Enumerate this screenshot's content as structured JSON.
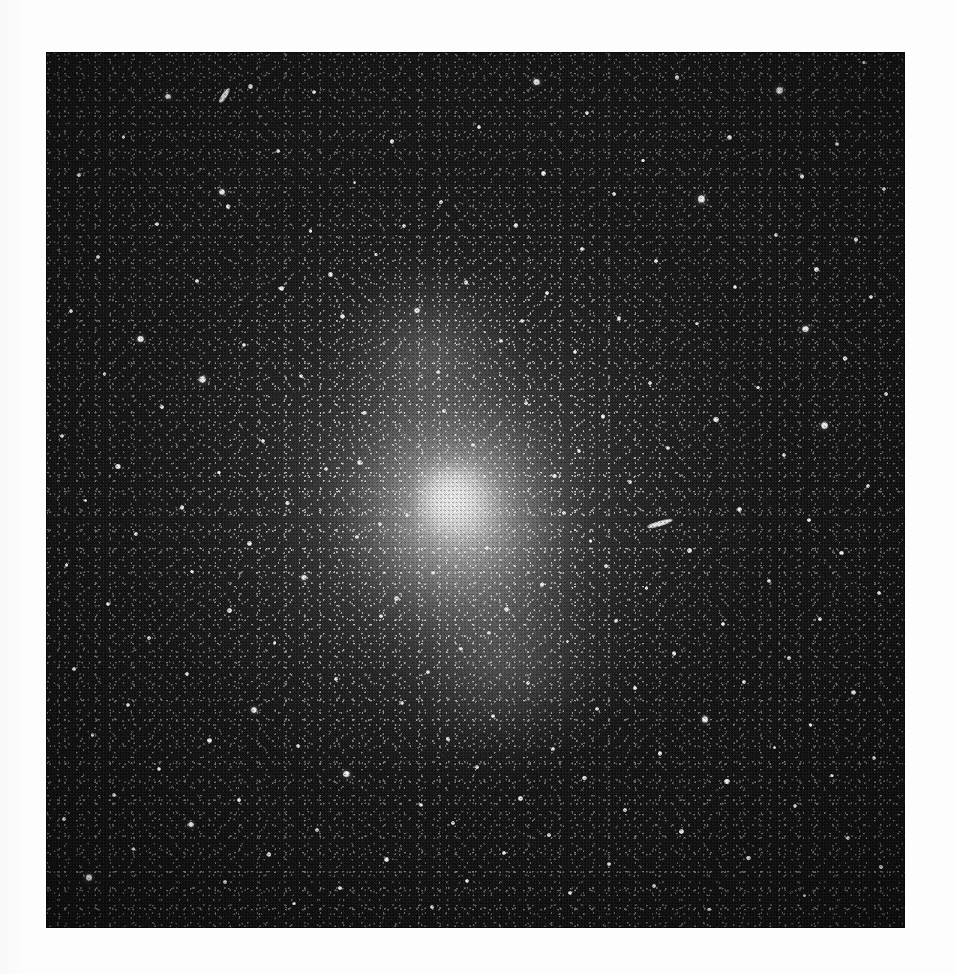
{
  "document": {
    "kind": "photographic-plate-reproduction",
    "subject": "globular star cluster",
    "caption": "",
    "background_color": "#fdfdfd"
  },
  "plate": {
    "left": 46,
    "top": 52,
    "width": 859,
    "height": 876,
    "sky_color": "#0c0c0c",
    "core_color": "#fcfcfc",
    "halo_color": "#9a9a9a"
  },
  "cluster": {
    "label": "globular cluster",
    "center_x_pct": 47,
    "center_y_pct": 50,
    "core_peak_x_pct": 47,
    "core_peak_y_pct": 51,
    "position_angle_deg": -18,
    "halo_extent_pct": 78
  },
  "defects": [
    {
      "name": "plate-scratch-upper-left",
      "x_pct": 19.8,
      "y_pct": 4.7,
      "length": 17,
      "thickness": 5,
      "angle": -58
    },
    {
      "name": "plate-scratch-mid-right",
      "x_pct": 70.0,
      "y_pct": 53.5,
      "length": 26,
      "thickness": 5,
      "angle": -17
    }
  ],
  "stars": [
    {
      "x": 14.2,
      "y": 5.1,
      "r": 2.4
    },
    {
      "x": 23.8,
      "y": 3.9,
      "r": 2.0
    },
    {
      "x": 31.2,
      "y": 4.6,
      "r": 1.6
    },
    {
      "x": 57.1,
      "y": 3.4,
      "r": 2.6
    },
    {
      "x": 73.5,
      "y": 2.9,
      "r": 1.8
    },
    {
      "x": 85.4,
      "y": 4.4,
      "r": 3.1
    },
    {
      "x": 95.2,
      "y": 1.2,
      "r": 1.5
    },
    {
      "x": 63.0,
      "y": 7.0,
      "r": 1.7
    },
    {
      "x": 50.4,
      "y": 8.6,
      "r": 1.6
    },
    {
      "x": 9.0,
      "y": 9.7,
      "r": 1.5
    },
    {
      "x": 40.3,
      "y": 10.2,
      "r": 1.9
    },
    {
      "x": 27.0,
      "y": 11.3,
      "r": 1.7
    },
    {
      "x": 79.6,
      "y": 9.8,
      "r": 2.1
    },
    {
      "x": 92.1,
      "y": 10.5,
      "r": 1.8
    },
    {
      "x": 69.5,
      "y": 12.4,
      "r": 1.6
    },
    {
      "x": 3.8,
      "y": 14.0,
      "r": 1.6
    },
    {
      "x": 35.9,
      "y": 14.9,
      "r": 1.6
    },
    {
      "x": 57.9,
      "y": 13.9,
      "r": 2.0
    },
    {
      "x": 88.0,
      "y": 14.2,
      "r": 2.0
    },
    {
      "x": 20.5,
      "y": 16.0,
      "r": 2.5
    },
    {
      "x": 21.2,
      "y": 17.6,
      "r": 2.0
    },
    {
      "x": 46.0,
      "y": 17.1,
      "r": 1.7
    },
    {
      "x": 66.1,
      "y": 16.2,
      "r": 1.5
    },
    {
      "x": 76.3,
      "y": 16.8,
      "r": 3.3
    },
    {
      "x": 97.5,
      "y": 15.6,
      "r": 1.7
    },
    {
      "x": 12.9,
      "y": 19.6,
      "r": 1.6
    },
    {
      "x": 30.8,
      "y": 20.4,
      "r": 1.6
    },
    {
      "x": 54.7,
      "y": 19.8,
      "r": 1.8
    },
    {
      "x": 85.0,
      "y": 20.9,
      "r": 2.0
    },
    {
      "x": 94.3,
      "y": 21.4,
      "r": 1.9
    },
    {
      "x": 6.1,
      "y": 23.4,
      "r": 1.7
    },
    {
      "x": 38.4,
      "y": 23.1,
      "r": 1.5
    },
    {
      "x": 62.4,
      "y": 22.5,
      "r": 1.6
    },
    {
      "x": 71.0,
      "y": 23.9,
      "r": 1.6
    },
    {
      "x": 89.7,
      "y": 24.8,
      "r": 2.2
    },
    {
      "x": 17.6,
      "y": 26.1,
      "r": 1.6
    },
    {
      "x": 27.4,
      "y": 27.0,
      "r": 2.3
    },
    {
      "x": 48.9,
      "y": 26.3,
      "r": 2.0
    },
    {
      "x": 58.3,
      "y": 27.5,
      "r": 1.6
    },
    {
      "x": 80.2,
      "y": 26.8,
      "r": 1.8
    },
    {
      "x": 96.0,
      "y": 28.0,
      "r": 1.7
    },
    {
      "x": 2.9,
      "y": 29.6,
      "r": 1.6
    },
    {
      "x": 34.5,
      "y": 30.2,
      "r": 2.1
    },
    {
      "x": 43.2,
      "y": 29.5,
      "r": 2.4
    },
    {
      "x": 66.7,
      "y": 30.4,
      "r": 1.9
    },
    {
      "x": 75.8,
      "y": 31.0,
      "r": 1.6
    },
    {
      "x": 88.4,
      "y": 31.6,
      "r": 2.8
    },
    {
      "x": 11.0,
      "y": 32.8,
      "r": 2.6
    },
    {
      "x": 23.0,
      "y": 33.5,
      "r": 1.7
    },
    {
      "x": 53.0,
      "y": 33.0,
      "r": 1.6
    },
    {
      "x": 61.6,
      "y": 34.3,
      "r": 1.7
    },
    {
      "x": 93.0,
      "y": 35.0,
      "r": 1.8
    },
    {
      "x": 6.8,
      "y": 36.8,
      "r": 1.6
    },
    {
      "x": 18.2,
      "y": 37.4,
      "r": 2.9
    },
    {
      "x": 29.7,
      "y": 37.0,
      "r": 1.8
    },
    {
      "x": 45.6,
      "y": 36.5,
      "r": 1.7
    },
    {
      "x": 70.3,
      "y": 37.8,
      "r": 2.0
    },
    {
      "x": 82.9,
      "y": 38.3,
      "r": 1.7
    },
    {
      "x": 97.8,
      "y": 39.0,
      "r": 1.6
    },
    {
      "x": 13.5,
      "y": 40.5,
      "r": 1.6
    },
    {
      "x": 37.1,
      "y": 41.2,
      "r": 1.9
    },
    {
      "x": 55.9,
      "y": 40.1,
      "r": 1.6
    },
    {
      "x": 64.8,
      "y": 41.6,
      "r": 1.8
    },
    {
      "x": 78.0,
      "y": 42.0,
      "r": 2.2
    },
    {
      "x": 90.6,
      "y": 42.6,
      "r": 3.0
    },
    {
      "x": 1.9,
      "y": 43.8,
      "r": 1.7
    },
    {
      "x": 25.3,
      "y": 44.4,
      "r": 1.8
    },
    {
      "x": 49.7,
      "y": 44.9,
      "r": 1.6
    },
    {
      "x": 72.4,
      "y": 45.2,
      "r": 1.7
    },
    {
      "x": 85.9,
      "y": 46.0,
      "r": 1.9
    },
    {
      "x": 8.4,
      "y": 47.3,
      "r": 2.3
    },
    {
      "x": 20.1,
      "y": 48.0,
      "r": 1.6
    },
    {
      "x": 32.6,
      "y": 47.6,
      "r": 1.7
    },
    {
      "x": 59.2,
      "y": 48.4,
      "r": 1.8
    },
    {
      "x": 68.0,
      "y": 49.1,
      "r": 1.6
    },
    {
      "x": 95.7,
      "y": 49.6,
      "r": 1.7
    },
    {
      "x": 4.6,
      "y": 51.2,
      "r": 1.6
    },
    {
      "x": 15.8,
      "y": 52.0,
      "r": 1.8
    },
    {
      "x": 28.1,
      "y": 51.5,
      "r": 1.9
    },
    {
      "x": 42.0,
      "y": 52.8,
      "r": 1.7
    },
    {
      "x": 80.7,
      "y": 52.2,
      "r": 2.1
    },
    {
      "x": 88.8,
      "y": 53.4,
      "r": 1.6
    },
    {
      "x": 10.5,
      "y": 55.0,
      "r": 1.7
    },
    {
      "x": 23.7,
      "y": 56.1,
      "r": 2.0
    },
    {
      "x": 36.2,
      "y": 55.4,
      "r": 1.6
    },
    {
      "x": 51.3,
      "y": 56.6,
      "r": 1.8
    },
    {
      "x": 63.4,
      "y": 55.8,
      "r": 1.6
    },
    {
      "x": 74.9,
      "y": 56.9,
      "r": 1.9
    },
    {
      "x": 92.6,
      "y": 57.2,
      "r": 2.0
    },
    {
      "x": 2.4,
      "y": 58.6,
      "r": 1.6
    },
    {
      "x": 17.0,
      "y": 59.3,
      "r": 1.6
    },
    {
      "x": 30.0,
      "y": 60.0,
      "r": 2.4
    },
    {
      "x": 45.1,
      "y": 59.5,
      "r": 1.7
    },
    {
      "x": 57.7,
      "y": 60.8,
      "r": 1.8
    },
    {
      "x": 69.9,
      "y": 61.2,
      "r": 1.6
    },
    {
      "x": 84.2,
      "y": 60.4,
      "r": 1.7
    },
    {
      "x": 97.0,
      "y": 61.8,
      "r": 1.8
    },
    {
      "x": 7.2,
      "y": 63.0,
      "r": 1.7
    },
    {
      "x": 21.4,
      "y": 63.8,
      "r": 2.2
    },
    {
      "x": 39.0,
      "y": 64.4,
      "r": 1.6
    },
    {
      "x": 53.6,
      "y": 63.6,
      "r": 2.1
    },
    {
      "x": 66.3,
      "y": 64.9,
      "r": 1.7
    },
    {
      "x": 78.8,
      "y": 65.3,
      "r": 1.9
    },
    {
      "x": 90.1,
      "y": 64.7,
      "r": 1.6
    },
    {
      "x": 12.0,
      "y": 66.9,
      "r": 1.8
    },
    {
      "x": 26.6,
      "y": 67.5,
      "r": 1.6
    },
    {
      "x": 48.3,
      "y": 68.1,
      "r": 1.7
    },
    {
      "x": 60.7,
      "y": 67.3,
      "r": 1.6
    },
    {
      "x": 73.1,
      "y": 68.7,
      "r": 2.0
    },
    {
      "x": 86.5,
      "y": 69.2,
      "r": 1.7
    },
    {
      "x": 3.3,
      "y": 70.4,
      "r": 1.6
    },
    {
      "x": 16.4,
      "y": 71.0,
      "r": 1.9
    },
    {
      "x": 33.8,
      "y": 71.6,
      "r": 1.7
    },
    {
      "x": 44.5,
      "y": 70.8,
      "r": 1.6
    },
    {
      "x": 56.1,
      "y": 72.0,
      "r": 1.8
    },
    {
      "x": 68.6,
      "y": 72.6,
      "r": 1.6
    },
    {
      "x": 81.3,
      "y": 71.9,
      "r": 1.7
    },
    {
      "x": 94.0,
      "y": 73.1,
      "r": 2.1
    },
    {
      "x": 9.6,
      "y": 74.5,
      "r": 1.7
    },
    {
      "x": 24.2,
      "y": 75.1,
      "r": 2.5
    },
    {
      "x": 41.4,
      "y": 74.3,
      "r": 1.8
    },
    {
      "x": 52.0,
      "y": 75.8,
      "r": 1.6
    },
    {
      "x": 64.1,
      "y": 75.0,
      "r": 1.7
    },
    {
      "x": 76.7,
      "y": 76.2,
      "r": 2.6
    },
    {
      "x": 89.0,
      "y": 76.8,
      "r": 1.7
    },
    {
      "x": 5.4,
      "y": 78.0,
      "r": 1.6
    },
    {
      "x": 19.0,
      "y": 78.6,
      "r": 2.0
    },
    {
      "x": 29.3,
      "y": 79.2,
      "r": 1.8
    },
    {
      "x": 46.8,
      "y": 78.4,
      "r": 1.6
    },
    {
      "x": 59.0,
      "y": 79.6,
      "r": 1.7
    },
    {
      "x": 71.5,
      "y": 80.1,
      "r": 1.9
    },
    {
      "x": 84.8,
      "y": 79.4,
      "r": 1.6
    },
    {
      "x": 96.4,
      "y": 80.6,
      "r": 1.8
    },
    {
      "x": 13.1,
      "y": 81.8,
      "r": 1.7
    },
    {
      "x": 35.0,
      "y": 82.4,
      "r": 2.8
    },
    {
      "x": 50.2,
      "y": 81.6,
      "r": 1.6
    },
    {
      "x": 62.7,
      "y": 82.9,
      "r": 1.9
    },
    {
      "x": 79.3,
      "y": 83.3,
      "r": 2.3
    },
    {
      "x": 91.5,
      "y": 82.6,
      "r": 1.6
    },
    {
      "x": 7.9,
      "y": 84.8,
      "r": 1.8
    },
    {
      "x": 22.5,
      "y": 85.4,
      "r": 1.6
    },
    {
      "x": 43.7,
      "y": 86.0,
      "r": 1.7
    },
    {
      "x": 55.2,
      "y": 85.2,
      "r": 2.0
    },
    {
      "x": 67.4,
      "y": 86.5,
      "r": 1.6
    },
    {
      "x": 87.2,
      "y": 86.1,
      "r": 1.7
    },
    {
      "x": 2.1,
      "y": 87.6,
      "r": 1.6
    },
    {
      "x": 16.9,
      "y": 88.2,
      "r": 2.4
    },
    {
      "x": 31.5,
      "y": 88.8,
      "r": 1.7
    },
    {
      "x": 47.4,
      "y": 88.0,
      "r": 1.8
    },
    {
      "x": 58.6,
      "y": 89.4,
      "r": 1.6
    },
    {
      "x": 74.0,
      "y": 89.0,
      "r": 2.0
    },
    {
      "x": 93.4,
      "y": 89.7,
      "r": 1.7
    },
    {
      "x": 10.2,
      "y": 91.0,
      "r": 1.6
    },
    {
      "x": 26.0,
      "y": 91.6,
      "r": 1.8
    },
    {
      "x": 39.6,
      "y": 92.2,
      "r": 2.2
    },
    {
      "x": 53.3,
      "y": 91.4,
      "r": 1.6
    },
    {
      "x": 65.5,
      "y": 92.7,
      "r": 1.7
    },
    {
      "x": 81.8,
      "y": 92.0,
      "r": 1.9
    },
    {
      "x": 97.2,
      "y": 93.0,
      "r": 1.6
    },
    {
      "x": 5.0,
      "y": 94.2,
      "r": 2.9
    },
    {
      "x": 20.8,
      "y": 94.8,
      "r": 1.7
    },
    {
      "x": 34.2,
      "y": 95.4,
      "r": 1.6
    },
    {
      "x": 49.0,
      "y": 94.6,
      "r": 1.8
    },
    {
      "x": 61.0,
      "y": 96.0,
      "r": 1.6
    },
    {
      "x": 70.8,
      "y": 95.2,
      "r": 1.7
    },
    {
      "x": 88.3,
      "y": 96.3,
      "r": 1.6
    },
    {
      "x": 44.9,
      "y": 97.6,
      "r": 1.8
    },
    {
      "x": 77.2,
      "y": 97.9,
      "r": 1.6
    },
    {
      "x": 28.9,
      "y": 97.2,
      "r": 1.6
    },
    {
      "x": 36.5,
      "y": 46.9,
      "r": 2.0
    },
    {
      "x": 40.8,
      "y": 62.4,
      "r": 2.1
    },
    {
      "x": 51.6,
      "y": 66.3,
      "r": 1.9
    },
    {
      "x": 62.1,
      "y": 45.5,
      "r": 1.7
    },
    {
      "x": 55.4,
      "y": 30.7,
      "r": 1.8
    },
    {
      "x": 33.1,
      "y": 25.4,
      "r": 1.9
    },
    {
      "x": 41.7,
      "y": 19.9,
      "r": 1.7
    },
    {
      "x": 60.3,
      "y": 52.6,
      "r": 1.6
    },
    {
      "x": 46.3,
      "y": 41.0,
      "r": 1.6
    },
    {
      "x": 38.9,
      "y": 53.9,
      "r": 1.7
    },
    {
      "x": 65.2,
      "y": 58.7,
      "r": 1.6
    }
  ]
}
